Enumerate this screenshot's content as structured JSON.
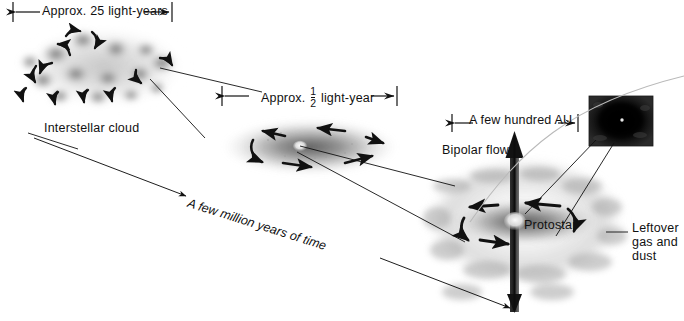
{
  "figure": {
    "background_color": "#ffffff",
    "ink_color": "#111111"
  },
  "dimensions": {
    "cloud_scale": "Approx. 25 light-years",
    "disk_scale_prefix": "Approx.",
    "disk_scale_fraction_numerator": "1",
    "disk_scale_fraction_denominator": "2",
    "disk_scale_suffix": "light-year",
    "protostar_scale": "A few hundred AU"
  },
  "labels": {
    "interstellar_cloud": "Interstellar cloud",
    "bipolar_flow": "Bipolar flow",
    "protostar": "Protostar",
    "leftover_gas_dust": "Leftover gas and dust",
    "timeline": "A few million years of time"
  },
  "icons": {
    "dimension_arrow": "dimension-arrow-icon",
    "rotation_arrow": "curved-rotation-arrow-icon",
    "jet_arrow": "bipolar-jet-arrow-icon",
    "leader_line": "leader-line-icon",
    "inset_photo": "protostar-inset-photo"
  }
}
